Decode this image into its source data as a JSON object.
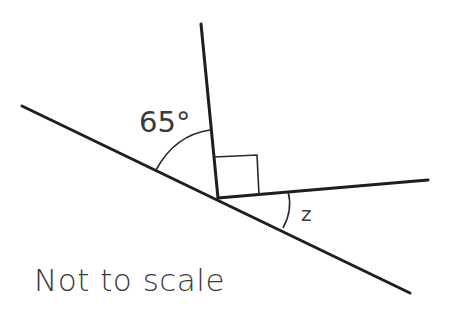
{
  "diagram": {
    "angle_label": "65°",
    "unknown_label": "z",
    "caption": "Not to scale",
    "right_angle_marker": true,
    "colors": {
      "line": "#1e1e1e",
      "text": "#3a3a3a",
      "background": "#ffffff"
    }
  }
}
